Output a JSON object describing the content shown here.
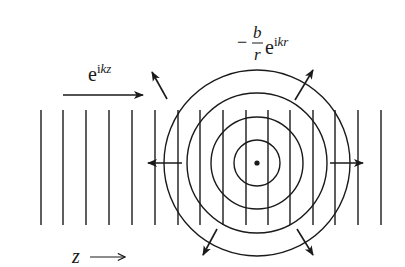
{
  "diagram": {
    "colors": {
      "stroke": "#1a1a1a",
      "background": "#ffffff"
    },
    "incident_wave": {
      "label_base": "e",
      "label_exponent_i": "i",
      "label_exponent_kz": "kz",
      "direction": "+z"
    },
    "scattered_wave": {
      "label_minus": "−",
      "label_numerator": "b",
      "label_denominator": "r",
      "label_base": "e",
      "label_exponent_i": "i",
      "label_exponent_kr": "kr"
    },
    "axis": {
      "label": "z",
      "arrow": "⟶"
    },
    "plane_wavefronts": {
      "count": 16,
      "x_positions": [
        41,
        63,
        86,
        109,
        132,
        155,
        178,
        200,
        223,
        246,
        268,
        290,
        313,
        335,
        358,
        381
      ],
      "y_top": 110,
      "y_bottom": 225
    },
    "scatterer": {
      "cx": 257,
      "cy": 163
    },
    "spherical_wavefronts": {
      "radii": [
        23,
        46,
        70,
        93
      ]
    },
    "radial_arrows": [
      "up-left",
      "up-right",
      "left",
      "right",
      "down-left",
      "down-right"
    ]
  }
}
